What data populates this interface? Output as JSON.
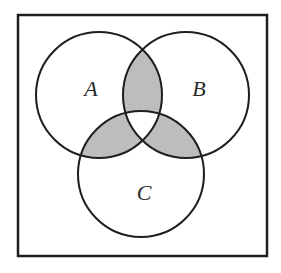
{
  "diagram": {
    "type": "venn",
    "universe_box": {
      "x": 18,
      "y": 15,
      "width": 249,
      "height": 241
    },
    "sets": [
      {
        "name": "A",
        "cx": 99,
        "cy": 95,
        "r": 63,
        "label_x": 91,
        "label_y": 96
      },
      {
        "name": "B",
        "cx": 186,
        "cy": 95,
        "r": 63,
        "label_x": 199,
        "label_y": 96
      },
      {
        "name": "C",
        "cx": 141,
        "cy": 174,
        "r": 63,
        "label_x": 144,
        "label_y": 200
      }
    ],
    "shaded_regions": [
      "A∩B only",
      "A∩C only",
      "B∩C only"
    ],
    "shade_color": "#bdbdbd",
    "stroke_color": "#1e1e1e"
  }
}
